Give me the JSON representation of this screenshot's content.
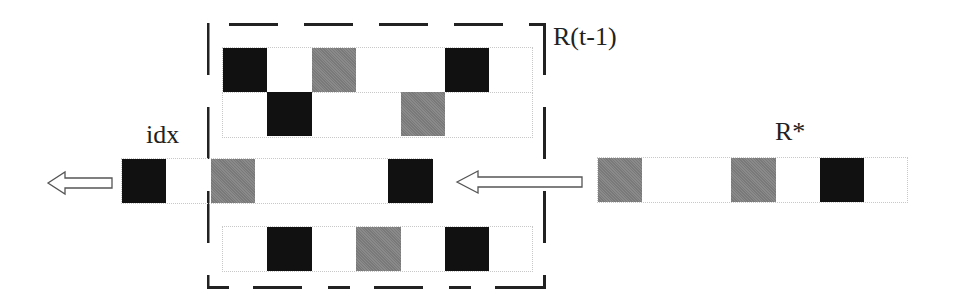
{
  "labels": {
    "prev_region": "R(t-1)",
    "target": "R*",
    "index": "idx"
  },
  "colors": {
    "black": "#111111",
    "gray": "#8a8a8a",
    "dash": "#222222"
  },
  "rows": {
    "prev_row_1": [
      "black",
      "empty",
      "gray",
      "empty",
      "empty",
      "black",
      "empty"
    ],
    "prev_row_2": [
      "empty",
      "black",
      "empty",
      "empty",
      "gray",
      "empty",
      "empty"
    ],
    "idx_row": [
      "black",
      "empty",
      "gray",
      "empty",
      "empty",
      "empty",
      "black"
    ],
    "bottom_row": [
      "empty",
      "black",
      "empty",
      "gray",
      "empty",
      "black",
      "empty"
    ],
    "target_row": [
      "gray",
      "empty",
      "empty",
      "gray",
      "empty",
      "black",
      "empty"
    ]
  }
}
